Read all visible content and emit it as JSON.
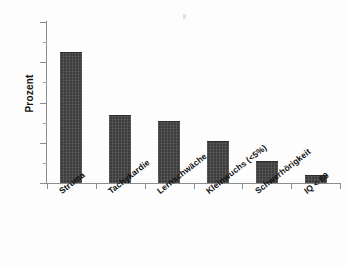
{
  "chart_data": {
    "type": "bar",
    "title": "",
    "subtitle": "",
    "xlabel": "",
    "ylabel": "Prozent",
    "ylim": [
      0,
      80
    ],
    "yticks": [
      0,
      20,
      40,
      60,
      80
    ],
    "ytick_labels": [
      "0",
      "20",
      "40",
      "60",
      "80"
    ],
    "yminor_ticks": [
      10,
      30,
      50,
      70
    ],
    "grid": false,
    "legend": false,
    "legend_position": "none",
    "bar_color": "#3d3d3d",
    "axis_color": "#8d8d8d",
    "background": "#ffffff",
    "categories": [
      "Struma",
      "Tachykardie",
      "Lernschwäche",
      "Kleinwuchs (<5%)",
      "Schwerhörigkeit",
      "IQ < 60"
    ],
    "values": [
      65,
      34,
      31,
      21,
      11,
      4
    ],
    "annotations": []
  }
}
